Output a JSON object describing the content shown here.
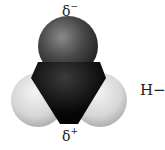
{
  "diagram": {
    "type": "space-filling molecular model",
    "molecule": "water",
    "labels": {
      "top_charge": "δ",
      "top_charge_sign": "−",
      "bottom_charge": "δ",
      "bottom_charge_sign": "+",
      "side_text": "H−"
    },
    "atoms": [
      {
        "name": "oxygen",
        "color": "#3a3a3a"
      },
      {
        "name": "hydrogen-left",
        "color": "#d9d9d9"
      },
      {
        "name": "hydrogen-right",
        "color": "#d9d9d9"
      }
    ],
    "colors": {
      "oxygen": "#3a3a3a",
      "wedge": "#0a0a0a",
      "hydrogen": "#d9d9d9",
      "text": "#222222"
    }
  }
}
